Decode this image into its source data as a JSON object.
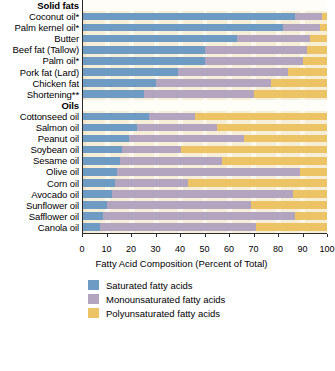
{
  "chart_data": {
    "type": "bar",
    "orientation": "horizontal",
    "stacked": true,
    "title": "",
    "xlabel": "Fatty Acid Composition (Percent of Total)",
    "ylabel": "",
    "xlim": [
      0,
      100
    ],
    "xticks": [
      0,
      10,
      20,
      30,
      40,
      50,
      60,
      70,
      80,
      90,
      100
    ],
    "grid": true,
    "legend_position": "bottom",
    "group_headers": [
      "Solid fats",
      "Oils"
    ],
    "series": [
      {
        "name": "Saturated fatty acids",
        "color": "#6d9bc4",
        "values": [
          87,
          82,
          63,
          50,
          50,
          39,
          30,
          25,
          27,
          22,
          19,
          16,
          15,
          14,
          13,
          12,
          10,
          8,
          7
        ]
      },
      {
        "name": "Monounsaturated fatty acids",
        "color": "#b3a4bf",
        "values": [
          11,
          15,
          30,
          42,
          40,
          45,
          47,
          45,
          19,
          33,
          47,
          24,
          42,
          75,
          30,
          74,
          59,
          79,
          64
        ]
      },
      {
        "name": "Polyunsaturated fatty acids",
        "color": "#edc465",
        "values": [
          2,
          3,
          7,
          8,
          10,
          16,
          23,
          30,
          54,
          45,
          34,
          60,
          43,
          11,
          57,
          14,
          31,
          13,
          29
        ]
      }
    ],
    "categories": [
      {
        "label": "Coconut oil*",
        "group": "Solid fats"
      },
      {
        "label": "Palm kernel oil*",
        "group": "Solid fats"
      },
      {
        "label": "Butter",
        "group": "Solid fats"
      },
      {
        "label": "Beef fat (Tallow)",
        "group": "Solid fats"
      },
      {
        "label": "Palm oil*",
        "group": "Solid fats"
      },
      {
        "label": "Pork fat (Lard)",
        "group": "Solid fats"
      },
      {
        "label": "Chicken fat",
        "group": "Solid fats"
      },
      {
        "label": "Shortening**",
        "group": "Solid fats"
      },
      {
        "label": "Cottonseed oil",
        "group": "Oils"
      },
      {
        "label": "Salmon oil",
        "group": "Oils"
      },
      {
        "label": "Peanut oil",
        "group": "Oils"
      },
      {
        "label": "Soybean oil",
        "group": "Oils"
      },
      {
        "label": "Sesame oil",
        "group": "Oils"
      },
      {
        "label": "Olive oil",
        "group": "Oils"
      },
      {
        "label": "Corn oil",
        "group": "Oils"
      },
      {
        "label": "Avocado oil",
        "group": "Oils"
      },
      {
        "label": "Sunflower oil",
        "group": "Oils"
      },
      {
        "label": "Safflower oil",
        "group": "Oils"
      },
      {
        "label": "Canola oil",
        "group": "Oils"
      }
    ]
  },
  "colors": {
    "saturated": "#6d9bc4",
    "monounsaturated": "#b3a4bf",
    "polyunsaturated": "#edc465",
    "axis": "#2b2b2b",
    "band_light": "#fdf8ec",
    "band_dark": "#f7eed8"
  }
}
